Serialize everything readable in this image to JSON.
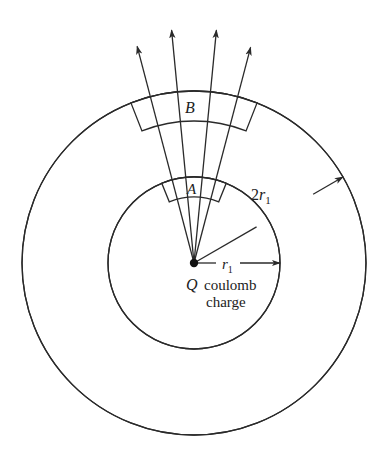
{
  "figure": {
    "labels": {
      "surface_outer": "B",
      "surface_inner": "A",
      "radius_outer_coef": "2",
      "radius_var": "r",
      "radius_sub": "1",
      "charge_symbol": "Q",
      "charge_text_1": "coulomb",
      "charge_text_2": "charge"
    },
    "geometry": {
      "center": [
        194,
        263
      ],
      "inner_radius": 86,
      "outer_radius": 172,
      "field_line_angles_deg": [
        -14.7,
        -5.5,
        5.5,
        14.7
      ]
    },
    "colors": {
      "stroke": "#2a2a2a",
      "background": "#ffffff"
    }
  }
}
